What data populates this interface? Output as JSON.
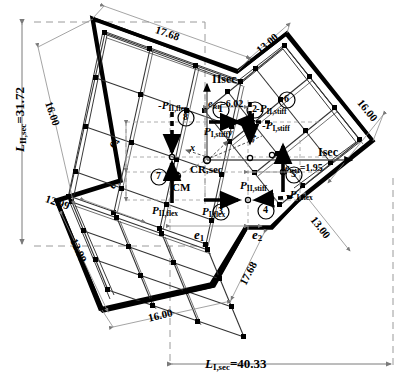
{
  "figure": {
    "type": "structural-plan-diagram"
  },
  "points": {
    "cr": "CR,sec",
    "cm": "CM"
  },
  "axes": {
    "global_i": "Isec",
    "global_ii": "IIsec",
    "local_x": "x",
    "local_y": "y",
    "angle": "24°"
  },
  "eccentricities": {
    "e_ri": "e",
    "e_ri_sub": "RI",
    "e_ri_val": "=6.02",
    "e_rii": "e",
    "e_rii_sub": "RII",
    "e_rii_val": "=1.95",
    "e1": "e",
    "e1_sub": "1",
    "e2": "e",
    "e2_sub": "2",
    "e3": "e",
    "e3_sub": "3",
    "e4": "e",
    "e4_sub": "4"
  },
  "overall_dims": {
    "left_label": "L",
    "left_sub": "II,sec",
    "left_val": "=31.72",
    "bottom_label": "L",
    "bottom_sub": "I,sec",
    "bottom_val": "=40.33"
  },
  "edge_dims": [
    {
      "id": "top-left-edge",
      "value": "17.68"
    },
    {
      "id": "top-right-edge",
      "value": "13.00"
    },
    {
      "id": "upper-left-side",
      "value": "16.00"
    },
    {
      "id": "upper-right-side",
      "value": "16.00"
    },
    {
      "id": "mid-left-step",
      "value": "12.99"
    },
    {
      "id": "mid-left-step-inner",
      "value": "12.99"
    },
    {
      "id": "bottom-left-edge",
      "value": "16.00"
    },
    {
      "id": "bottom-right-edge",
      "value": "17.68"
    },
    {
      "id": "right-lower-edge",
      "value": "13.00"
    }
  ],
  "forces": [
    {
      "n": "1",
      "label": "P",
      "sub": "I,stiff",
      "sign": "",
      "dir": "right",
      "style": "solid"
    },
    {
      "n": "2",
      "label": "P",
      "sub": "I,stiff",
      "sign": "-",
      "dir": "left",
      "style": "dashed"
    },
    {
      "n": "3",
      "label": "P",
      "sub": "I,flex",
      "sign": "",
      "dir": "right",
      "style": "solid"
    },
    {
      "n": "4",
      "label": "P",
      "sub": "I,flex",
      "sign": "-",
      "dir": "left",
      "style": "dashed"
    },
    {
      "n": "5",
      "label": "P",
      "sub": "II,stiff",
      "sign": "",
      "dir": "up",
      "style": "solid"
    },
    {
      "n": "6",
      "label": "P",
      "sub": "II,stiff",
      "sign": "-",
      "dir": "down",
      "style": "dashed"
    },
    {
      "n": "7",
      "label": "P",
      "sub": "II,flex",
      "sign": "",
      "dir": "up",
      "style": "solid"
    },
    {
      "n": "8",
      "label": "P",
      "sub": "II,flex",
      "sign": "-",
      "dir": "down",
      "style": "dashed"
    }
  ],
  "colors": {
    "line": "#000000",
    "dim": "#7a7a7a",
    "dashed_guide": "#8c8c8c"
  }
}
